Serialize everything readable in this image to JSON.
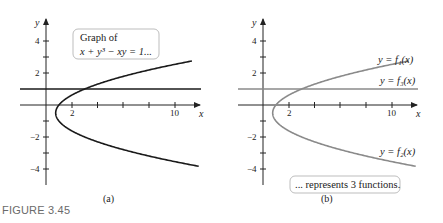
{
  "figure": {
    "caption": "FIGURE 3.45",
    "colors": {
      "curve_a": "#1a1a1a",
      "curve_b": "#8a8a8a",
      "axis": "#222222",
      "box_border": "#b5b5b5"
    }
  },
  "panel_a": {
    "label": "(a)",
    "x_axis_label": "x",
    "y_axis_label": "y",
    "x_tick_labels": [
      "2",
      "10"
    ],
    "y_tick_labels": [
      "4",
      "2",
      "−2",
      "−4"
    ],
    "annotation_line1": "Graph of",
    "annotation_line2": "x + y³ − xy = 1..."
  },
  "panel_b": {
    "label": "(b)",
    "x_axis_label": "x",
    "y_axis_label": "y",
    "x_tick_labels": [
      "2",
      "10"
    ],
    "y_tick_labels": [
      "4",
      "2",
      "−2",
      "−4"
    ],
    "f1_label": "y = f₁(x)",
    "f3_label": "y = f₃(x)",
    "f2_label": "y = f₂(x)",
    "annotation": "... represents 3 functions."
  },
  "chart_data": [
    {
      "type": "line",
      "title": "Graph of x + y^3 - xy = 1",
      "xlabel": "x",
      "ylabel": "y",
      "xlim": [
        -1,
        11.5
      ],
      "ylim": [
        -5,
        5
      ],
      "x_ticks": [
        2,
        4,
        6,
        8,
        10
      ],
      "y_ticks": [
        -4,
        -3,
        -2,
        -1,
        1,
        2,
        3,
        4
      ],
      "series": [
        {
          "name": "curve",
          "equation": "x = 1 + y + y^2 (y != 1)"
        },
        {
          "name": "horizontal line",
          "equation": "y = 1"
        }
      ]
    },
    {
      "type": "line",
      "title": "... represents 3 functions",
      "xlabel": "x",
      "ylabel": "y",
      "xlim": [
        -1,
        11.5
      ],
      "ylim": [
        -5,
        5
      ],
      "series": [
        {
          "name": "y = f1(x)",
          "equation": "upper branch, y > -1/2"
        },
        {
          "name": "y = f2(x)",
          "equation": "lower branch, y < -1/2"
        },
        {
          "name": "y = f3(x)",
          "equation": "y = 1"
        }
      ]
    }
  ]
}
